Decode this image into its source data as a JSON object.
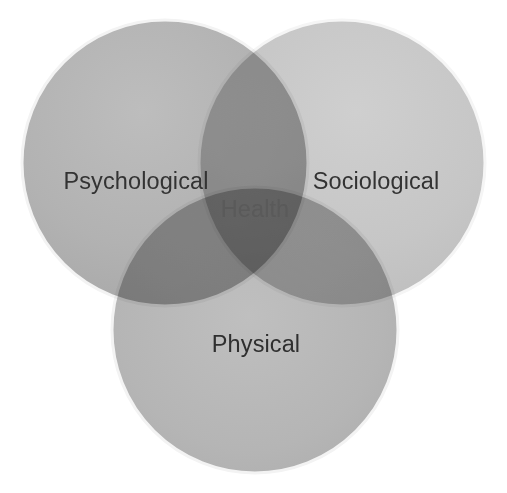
{
  "diagram": {
    "type": "venn",
    "title": "Health",
    "set_count": 3,
    "background_color": "#ffffff",
    "canvas": {
      "width": 507,
      "height": 493
    },
    "sets": [
      {
        "id": "psychological",
        "label": "Psychological",
        "position": "top-left",
        "fill_color": "#b1b1b1",
        "rim_color": "#f2f2f2",
        "label_color": "#333333",
        "center": {
          "x": 165,
          "y": 163
        },
        "radius": 143
      },
      {
        "id": "sociological",
        "label": "Sociological",
        "position": "top-right",
        "fill_color": "#c6c6c6",
        "rim_color": "#f4f4f4",
        "label_color": "#333333",
        "center": {
          "x": 342,
          "y": 163
        },
        "radius": 143
      },
      {
        "id": "physical",
        "label": "Physical",
        "position": "bottom-center",
        "fill_color": "#b4b4b4",
        "rim_color": "#f2f2f2",
        "label_color": "#2f2f2f",
        "center": {
          "x": 255,
          "y": 330
        },
        "radius": 143
      }
    ],
    "intersection": {
      "id": "health",
      "label": "Health",
      "label_color": "#5a5a5a",
      "members": [
        "Psychological",
        "Sociological",
        "Physical"
      ]
    }
  }
}
